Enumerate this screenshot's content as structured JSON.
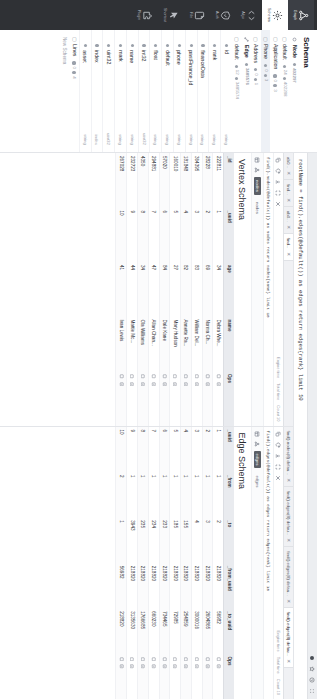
{
  "browser": {
    "icons": [
      "extension-icon",
      "bookmark-star-icon",
      "history-icon",
      "menu-grid-icon"
    ]
  },
  "query_bar": {
    "text": "rootName = find().edges(@default()) as edges return edges{rank} limit 10"
  },
  "rail": {
    "items": [
      {
        "label": "Graph",
        "icon": "graph-network-icon",
        "state": "active"
      },
      {
        "label": "Schema",
        "icon": "gear-icon",
        "state": "light"
      },
      {
        "label": "Algo",
        "icon": "code-brackets-icon",
        "state": "normal"
      },
      {
        "label": "Auth",
        "icon": "shield-check-icon",
        "state": "normal"
      },
      {
        "label": "File",
        "icon": "file-icon",
        "state": "normal"
      },
      {
        "label": "Shortcut",
        "icon": "cursor-arrow-icon",
        "state": "normal"
      },
      {
        "label": "Plugin",
        "icon": "plugin-icon",
        "state": "normal"
      }
    ]
  },
  "sidebar": {
    "title": "Schema",
    "new_schema_label": "New Schema",
    "tree": [
      {
        "kind": "group",
        "icon": "node-icon",
        "name": "Node",
        "count": "402297",
        "type": ""
      },
      {
        "kind": "item",
        "icon": "checkbox-icon",
        "name": "default",
        "badge": "24",
        "count": "402288"
      },
      {
        "kind": "item",
        "icon": "checkbox-icon",
        "name": "Application",
        "badge": "0",
        "count": "3"
      },
      {
        "kind": "item",
        "icon": "checkbox-icon",
        "name": "Phone",
        "badge": "0",
        "count": "3",
        "selected": true
      },
      {
        "kind": "item",
        "icon": "checkbox-icon",
        "name": "Address",
        "badge": "0",
        "count": "1"
      },
      {
        "kind": "group",
        "icon": "edge-icon",
        "name": "Edge",
        "count": "3485576",
        "type": ""
      },
      {
        "kind": "item",
        "icon": "checkbox-icon",
        "name": "default",
        "badge": "12",
        "count": "3485574"
      },
      {
        "kind": "item",
        "icon": "checkbox-icon",
        "name": "Lines",
        "badge": "0",
        "count": "4"
      }
    ],
    "properties": [
      {
        "name": "id",
        "type": "string"
      },
      {
        "name": "rank",
        "type": "string"
      },
      {
        "name": "financeData",
        "type": "string"
      },
      {
        "name": "pastFinance_id",
        "type": "string"
      },
      {
        "name": "phone",
        "type": "string"
      },
      {
        "name": "default",
        "type": "string"
      },
      {
        "name": "float",
        "type": "string"
      },
      {
        "name": "int32",
        "type": "uint32"
      },
      {
        "name": "name",
        "type": "string"
      },
      {
        "name": "mark",
        "type": "string"
      },
      {
        "name": "uint32",
        "type": "uint32"
      },
      {
        "name": "index",
        "type": "index"
      },
      {
        "name": "asset",
        "type": "string"
      }
    ]
  },
  "panels": [
    {
      "id": "vertex",
      "title": "Vertex Schema",
      "tabs": [
        {
          "label": "ab0...",
          "active": false
        },
        {
          "label": "find...",
          "active": false
        },
        {
          "label": "ab0...",
          "active": false
        },
        {
          "label": "find...",
          "active": true
        }
      ],
      "query_line": "find().nodes(@default()) as nodes return nodes{name} limit 10",
      "toolbar": {
        "icons": [
          "copy-icon",
          "redo-icon",
          "download-icon",
          "fullscreen-icon",
          "close-icon"
        ],
        "stats": [
          "Engine time",
          "Total time",
          "Count 10"
        ]
      },
      "subtabs": [
        {
          "label": "nodes",
          "active": true
        },
        {
          "label": "nodes",
          "active": false
        }
      ],
      "subtab_icons": [
        "table-view-icon",
        "graph-view-icon"
      ],
      "columns": [
        "_id",
        "_uuid",
        "age",
        "name",
        "Ops"
      ],
      "rows": [
        {
          "_id": "222811",
          "_uuid": "1",
          "age": "34",
          "name": "Debra Whe..."
        },
        {
          "_id": "28228",
          "_uuid": "2",
          "age": "69",
          "name": "Norma Ch..."
        },
        {
          "_id": "364395",
          "_uuid": "3",
          "age": "83",
          "name": "William Del..."
        },
        {
          "_id": "181848",
          "_uuid": "4",
          "age": "82",
          "name": "Annette Ra..."
        },
        {
          "_id": "160010",
          "_uuid": "5",
          "age": "27",
          "name": "Mary Hudson"
        },
        {
          "_id": "57020",
          "_uuid": "6",
          "age": "84",
          "name": "Dale Kane"
        },
        {
          "_id": "294881",
          "_uuid": "7",
          "age": "47",
          "name": "Allan Chan..."
        },
        {
          "_id": "4350",
          "_uuid": "8",
          "age": "34",
          "name": "Ola Williams"
        },
        {
          "_id": "232723",
          "_uuid": "9",
          "age": "44",
          "name": "Mattie Mc..."
        },
        {
          "_id": "267028",
          "_uuid": "10",
          "age": "41",
          "name": "Ivan Lewis"
        }
      ],
      "ops_icons": [
        "expand-node-icon",
        "detail-icon"
      ]
    },
    {
      "id": "edge",
      "title": "Edge Schema",
      "tabs": [
        {
          "label": "find().nodes(8) defau...",
          "active": false
        },
        {
          "label": "find().edges(8) defau...",
          "active": false
        },
        {
          "label": "find().edges(8) defau...",
          "active": false
        },
        {
          "label": "find().edges(8) defau...",
          "active": true
        }
      ],
      "query_line": "find().edges(@default()) as edges return edges{rank} limit 10",
      "toolbar": {
        "icons": [
          "copy-icon",
          "redo-icon",
          "download-icon",
          "fullscreen-icon",
          "close-icon"
        ],
        "stats": [
          "Engine time",
          "Total time",
          "Count 10"
        ]
      },
      "subtabs": [
        {
          "label": "edges",
          "active": true
        },
        {
          "label": "edges",
          "active": false
        }
      ],
      "subtab_icons": [
        "table-view-icon",
        "graph-view-icon"
      ],
      "columns": [
        "_uuid",
        "_from",
        "_to",
        "_from_uuid",
        "_to_uuid",
        "Ops"
      ],
      "rows": [
        {
          "_uuid": "1",
          "_from": "1",
          "_to": "2",
          "_from_uuid": "218820",
          "_to_uuid": "56982"
        },
        {
          "_uuid": "2",
          "_from": "1",
          "_to": "3",
          "_from_uuid": "218820",
          "_to_uuid": "2604865"
        },
        {
          "_uuid": "3",
          "_from": "1",
          "_to": "4",
          "_from_uuid": "218820",
          "_to_uuid": "3000016"
        },
        {
          "_uuid": "4",
          "_from": "1",
          "_to": "155",
          "_from_uuid": "218820",
          "_to_uuid": "254859"
        },
        {
          "_uuid": "5",
          "_from": "1",
          "_to": "185",
          "_from_uuid": "218820",
          "_to_uuid": "72985"
        },
        {
          "_uuid": "6",
          "_from": "1",
          "_to": "233",
          "_from_uuid": "218820",
          "_to_uuid": "734465"
        },
        {
          "_uuid": "7",
          "_from": "1",
          "_to": "234",
          "_from_uuid": "218820",
          "_to_uuid": "660230"
        },
        {
          "_uuid": "8",
          "_from": "1",
          "_to": "235",
          "_from_uuid": "218820",
          "_to_uuid": "1766685"
        },
        {
          "_uuid": "9",
          "_from": "1",
          "_to": "3943",
          "_from_uuid": "218820",
          "_to_uuid": "3135630"
        },
        {
          "_uuid": "10",
          "_from": "2",
          "_to": "1",
          "_from_uuid": "56982",
          "_to_uuid": "218820"
        }
      ],
      "ops_icons": [
        "expand-node-icon",
        "detail-icon"
      ]
    }
  ],
  "colors": {
    "rail_bg": "#2f3135",
    "accent": "#5b5f66",
    "header_bg": "#e9ebef",
    "page_bg": "#f4f5f7"
  }
}
